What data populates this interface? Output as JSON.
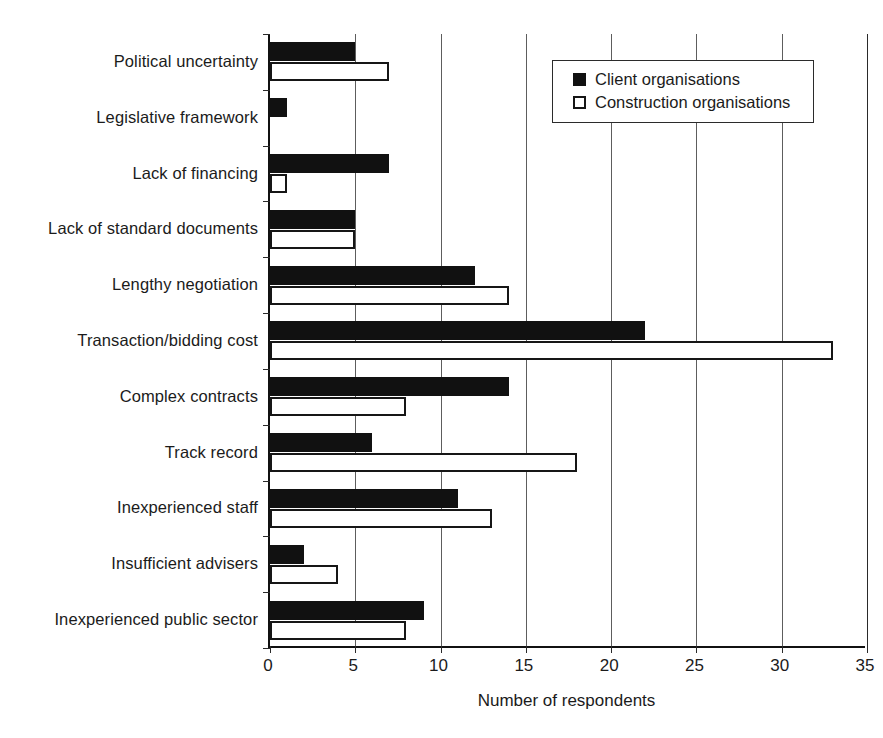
{
  "chart_data": {
    "type": "bar",
    "orientation": "horizontal",
    "title": "",
    "xlabel": "Number of respondents",
    "ylabel": "",
    "xlim": [
      0,
      35
    ],
    "xticks": [
      0,
      5,
      10,
      15,
      20,
      25,
      30,
      35
    ],
    "grid": true,
    "grid_axis": "x",
    "legend_position": "top-right",
    "categories": [
      "Political uncertainty",
      "Legislative framework",
      "Lack of financing",
      "Lack of standard documents",
      "Lengthy negotiation",
      "Transaction/bidding cost",
      "Complex contracts",
      "Track record",
      "Inexperienced staff",
      "Insufficient advisers",
      "Inexperienced public sector"
    ],
    "series": [
      {
        "name": "Client organisations",
        "style": "filled",
        "color": "#111111",
        "values": [
          5,
          1,
          7,
          5,
          12,
          22,
          14,
          6,
          11,
          2,
          9
        ]
      },
      {
        "name": "Construction organisations",
        "style": "hollow",
        "color": "#ffffff",
        "edge_color": "#161616",
        "values": [
          7,
          0,
          1,
          5,
          14,
          33,
          8,
          18,
          13,
          4,
          8
        ]
      }
    ]
  },
  "legend": {
    "items": [
      {
        "label": "Client organisations",
        "swatch": "filled-square-icon"
      },
      {
        "label": "Construction organisations",
        "swatch": "hollow-square-icon"
      }
    ]
  },
  "axis": {
    "x_title": "Number of respondents",
    "x_tick_labels": [
      "0",
      "5",
      "10",
      "15",
      "20",
      "25",
      "30",
      "35"
    ]
  }
}
